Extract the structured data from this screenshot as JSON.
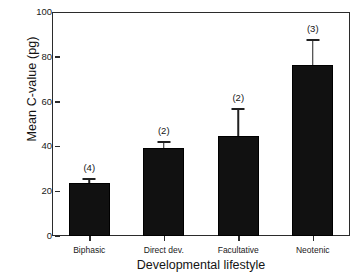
{
  "chart_data": {
    "type": "bar",
    "title": "",
    "xlabel": "Developmental lifestyle",
    "ylabel": "Mean C-value (pg)",
    "categories": [
      "Biphasic",
      "Direct dev.",
      "Facultative",
      "Neotenic"
    ],
    "values": [
      23.5,
      39.5,
      44.7,
      76.5
    ],
    "errors": [
      2.5,
      3.0,
      12.5,
      11.5
    ],
    "annotations": [
      "(4)",
      "(2)",
      "(2)",
      "(3)"
    ],
    "sample_sizes": [
      4,
      2,
      2,
      3
    ],
    "ylim": [
      0,
      100
    ],
    "yticks": [
      0,
      20,
      40,
      60,
      80,
      100
    ],
    "ytick_labels": [
      "0",
      "20",
      "40",
      "60",
      "80",
      "100"
    ],
    "grid": false,
    "legend": false,
    "bar_color": "#111111",
    "error_bar_color": "#202020",
    "axis_color": "#2b2b2b",
    "background_color": "#ffffff",
    "error_bar_type": "upper-only"
  }
}
